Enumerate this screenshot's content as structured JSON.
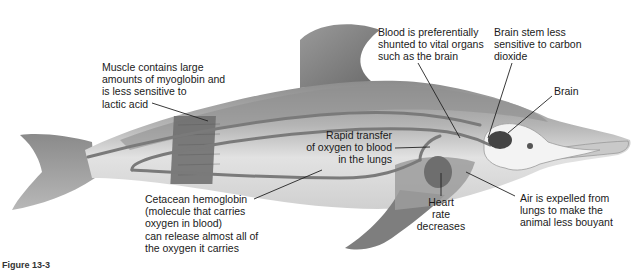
{
  "figure": {
    "caption": "Figure 13-3",
    "colors": {
      "body_light": "#d8d8d8",
      "body_dark": "#8a8a8a",
      "fin_dark": "#777777",
      "muscle_band": "#6e6e6e",
      "vessel": "#7a7a7a",
      "lung": "#9a9a9a",
      "heart": "#6f6f6f",
      "brain": "#4a4a4a",
      "leader_line": "#222222",
      "text": "#1a1a1a"
    }
  },
  "labels": {
    "muscle": "Muscle contains large\namounts of myoglobin and\nis less sensitive to\nlactic acid",
    "blood_shunt": "Blood is preferentially\nshunted to vital organs\nsuch as the brain",
    "brain_stem": "Brain stem less\nsensitive to carbon\ndioxide",
    "brain": "Brain",
    "oxygen_transfer": "Rapid transfer\nof oxygen to blood\nin the lungs",
    "hemoglobin": "Cetacean hemoglobin\n(molecule that carries\noxygen in blood)\ncan release almost all of\nthe oxygen it carries",
    "heart_rate": "Heart\nrate\ndecreases",
    "air_expelled": "Air is expelled from\nlungs to make the\nanimal less bouyant"
  }
}
